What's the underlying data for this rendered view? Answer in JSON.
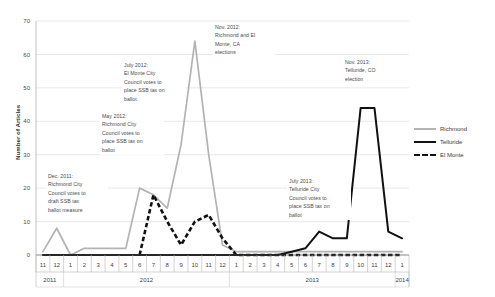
{
  "chart_data": {
    "type": "line",
    "title": "",
    "xlabel": "",
    "ylabel": "Number of Articles",
    "ylim": [
      0,
      70
    ],
    "yticks": [
      0,
      10,
      20,
      30,
      40,
      50,
      60,
      70
    ],
    "grid": true,
    "legend_position": "right",
    "x": [
      "11",
      "12",
      "1",
      "2",
      "3",
      "4",
      "5",
      "6",
      "7",
      "8",
      "9",
      "10",
      "11",
      "12",
      "1",
      "2",
      "3",
      "4",
      "5",
      "6",
      "7",
      "8",
      "9",
      "10",
      "11",
      "12",
      "1"
    ],
    "x_group_labels": [
      {
        "label": "2011",
        "start": 0,
        "end": 1
      },
      {
        "label": "2012",
        "start": 2,
        "end": 13
      },
      {
        "label": "2013",
        "start": 14,
        "end": 25
      },
      {
        "label": "2014",
        "start": 26,
        "end": 26
      }
    ],
    "series": [
      {
        "name": "Richmond",
        "color": "#b3b3b3",
        "style": "solid",
        "values": [
          1,
          8,
          0,
          2,
          2,
          2,
          2,
          20,
          18,
          14,
          33,
          64,
          30,
          3,
          1,
          1,
          1,
          1,
          1,
          1,
          1,
          1,
          1,
          1,
          1,
          1,
          1
        ]
      },
      {
        "name": "Telluride",
        "color": "#111111",
        "style": "solid",
        "values": [
          0,
          0,
          0,
          0,
          0,
          0,
          0,
          0,
          0,
          0,
          0,
          0,
          0,
          0,
          0,
          0,
          0,
          0,
          1,
          2,
          7,
          5,
          5,
          44,
          44,
          7,
          5
        ]
      },
      {
        "name": "El Monte",
        "color": "#111111",
        "style": "dashed",
        "values": [
          null,
          null,
          null,
          null,
          null,
          null,
          null,
          0,
          18,
          10,
          3,
          10,
          12,
          5,
          0,
          0,
          0,
          0,
          0,
          0,
          0,
          0,
          0,
          0,
          0,
          0,
          0
        ]
      }
    ],
    "annotations": [
      {
        "id": "dec-2011",
        "text": "Dec. 2011:\nRichmond City\nCouncil votes to\ndraft SSB tax\nballot measure",
        "x_px": 46,
        "y_px": 171,
        "width_px": 58
      },
      {
        "id": "may-2012",
        "text": "May 2012:\nRichmond City\nCouncil votes to\nplace SSB tax on\nballot",
        "x_px": 100,
        "y_px": 111,
        "width_px": 60
      },
      {
        "id": "july-2012",
        "text": "July 2012:\nEl Monte City\nCouncil votes to\nplace SSB tax on\nballot",
        "x_px": 122,
        "y_px": 60,
        "width_px": 60
      },
      {
        "id": "nov-2012",
        "text": "Nov. 2012:\nRichmond and El\nMonte, CA\nelections",
        "x_px": 213,
        "y_px": 22,
        "width_px": 58
      },
      {
        "id": "nov-2013",
        "text": "Nov. 2013:\nTelluride, CO\nelection",
        "x_px": 343,
        "y_px": 57,
        "width_px": 55
      },
      {
        "id": "july-2013",
        "text": "July 2013:\nTelluride City\nCouncil votes to\nplace SSB tax on\nballot",
        "x_px": 287,
        "y_px": 176,
        "width_px": 60
      }
    ]
  }
}
